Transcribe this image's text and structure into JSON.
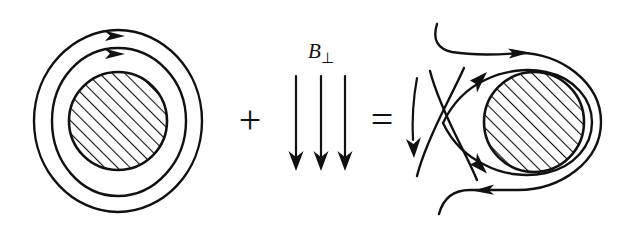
{
  "figure": {
    "background_color": "#ffffff",
    "ink_color": "#111111",
    "width": 621,
    "height": 235
  },
  "operators": {
    "plus": "+",
    "equals": "="
  },
  "labels": {
    "b_perp_base": "B",
    "b_perp_sub": "⊥",
    "b_perp_full": "B⊥"
  },
  "panels": {
    "left": {
      "name": "axisymmetric-field-panel",
      "description": "Hatched circular conductor cross-section encircled by two concentric clockwise closed field lines",
      "center": [
        118,
        121
      ],
      "core_radius": 49,
      "rings": [
        {
          "rx": 66,
          "ry": 74,
          "arrow_at": "top",
          "direction": "clockwise"
        },
        {
          "rx": 84,
          "ry": 91,
          "arrow_at": "top",
          "direction": "clockwise"
        }
      ],
      "hatch_angle_deg": 45,
      "hatch_spacing": 9
    },
    "middle": {
      "name": "perpendicular-field-panel",
      "description": "Three straight vertical field lines pointing downward labelled B perpendicular",
      "arrow_count": 3,
      "arrow_x": [
        296,
        321,
        345
      ],
      "arrow_top_y": 75,
      "arrow_tip_y": 170,
      "label_position": [
        321,
        52
      ],
      "direction": "down"
    },
    "right": {
      "name": "superposed-field-panel",
      "description": "Resulting field: separatrix X-point on the left with open incoming and outgoing field lines, closed flux wrapping the hatched conductor",
      "center": [
        534,
        122
      ],
      "core_radius": 50,
      "wrap_rings": [
        {
          "r": 58
        },
        {
          "r": 67
        }
      ],
      "x_point": [
        443,
        123
      ],
      "hatch_angle_deg": 45,
      "hatch_spacing": 9,
      "arrow_directions": {
        "top_open": "right",
        "left_vertical": "down",
        "upper_separatrix": "up-right",
        "lower_separatrix": "up-left",
        "bottom_open": "left"
      }
    }
  }
}
